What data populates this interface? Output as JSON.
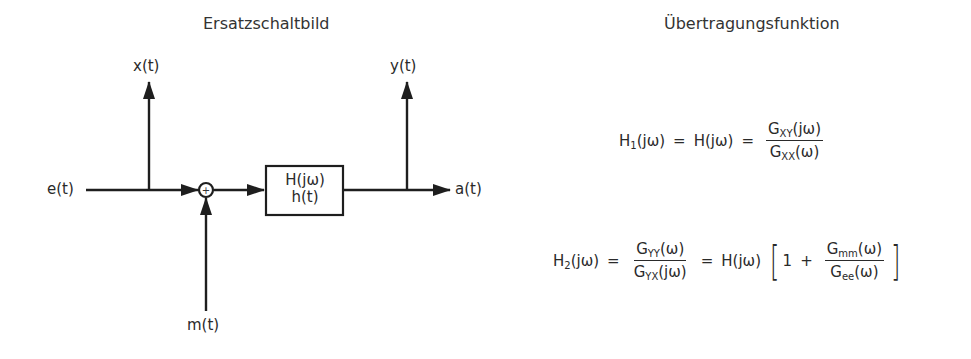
{
  "left_panel": {
    "title": "Ersatzschaltbild",
    "signals": {
      "input": "e(t)",
      "measured_input": "x(t)",
      "measured_output": "y(t)",
      "output": "a(t)",
      "noise": "m(t)"
    },
    "summing_junction": "+",
    "system_block": {
      "line1": "H(jω)",
      "line2": "h(t)"
    }
  },
  "right_panel": {
    "title": "Übertragungsfunktion",
    "h1": {
      "lhs": "H",
      "lhs_sub": "1",
      "lhs_arg": "(jω)",
      "eq": "=",
      "mid": "H(jω)",
      "eq2": "=",
      "num": "G",
      "num_sub": "XY",
      "num_arg": "(jω)",
      "den": "G",
      "den_sub": "XX",
      "den_arg": "(ω)"
    },
    "h2": {
      "lhs": "H",
      "lhs_sub": "2",
      "lhs_arg": "(jω)",
      "eq": "=",
      "num": "G",
      "num_sub": "YY",
      "num_arg": "(ω)",
      "den": "G",
      "den_sub": "YX",
      "den_arg": "(jω)",
      "eq2": "=",
      "mid": "H(jω)",
      "open_bracket": "[",
      "one": "1",
      "plus": "+",
      "num2": "G",
      "num2_sub": "mm",
      "num2_arg": "(ω)",
      "den2": "G",
      "den2_sub": "ee",
      "den2_arg": "(ω)",
      "close_bracket": "]"
    }
  }
}
